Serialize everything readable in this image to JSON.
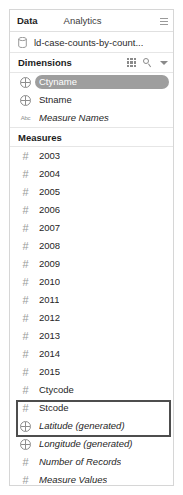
{
  "panel": {
    "tabs": [
      {
        "label": "Data",
        "active": true
      },
      {
        "label": "Analytics",
        "active": false
      }
    ],
    "sort_icon": "sort-icon"
  },
  "datasource": {
    "icon": "database-icon",
    "name": "ld-case-counts-by-count..."
  },
  "dimensions": {
    "title": "Dimensions",
    "tools": [
      {
        "icon": "grid-view-icon"
      },
      {
        "icon": "search-icon"
      },
      {
        "icon": "chevron-down-icon"
      }
    ],
    "fields": [
      {
        "label": "Ctyname",
        "icon": "globe-icon",
        "italic": false,
        "selected": true
      },
      {
        "label": "Stname",
        "icon": "globe-icon",
        "italic": false,
        "selected": false
      },
      {
        "label": "Measure Names",
        "icon": "abc-icon",
        "italic": true,
        "selected": false
      }
    ]
  },
  "measures": {
    "title": "Measures",
    "fields": [
      {
        "label": "2003",
        "icon": "hash-icon",
        "italic": false
      },
      {
        "label": "2004",
        "icon": "hash-icon",
        "italic": false
      },
      {
        "label": "2005",
        "icon": "hash-icon",
        "italic": false
      },
      {
        "label": "2006",
        "icon": "hash-icon",
        "italic": false
      },
      {
        "label": "2007",
        "icon": "hash-icon",
        "italic": false
      },
      {
        "label": "2008",
        "icon": "hash-icon",
        "italic": false
      },
      {
        "label": "2009",
        "icon": "hash-icon",
        "italic": false
      },
      {
        "label": "2010",
        "icon": "hash-icon",
        "italic": false
      },
      {
        "label": "2011",
        "icon": "hash-icon",
        "italic": false
      },
      {
        "label": "2012",
        "icon": "hash-icon",
        "italic": false
      },
      {
        "label": "2013",
        "icon": "hash-icon",
        "italic": false
      },
      {
        "label": "2014",
        "icon": "hash-icon",
        "italic": false
      },
      {
        "label": "2015",
        "icon": "hash-icon",
        "italic": false
      },
      {
        "label": "Ctycode",
        "icon": "hash-icon",
        "italic": false
      },
      {
        "label": "Stcode",
        "icon": "hash-icon",
        "italic": false
      },
      {
        "label": "Latitude (generated)",
        "icon": "globe-icon",
        "italic": true
      },
      {
        "label": "Longitude (generated)",
        "icon": "globe-icon",
        "italic": true
      },
      {
        "label": "Number of Records",
        "icon": "hash-icon",
        "italic": true
      },
      {
        "label": "Measure Values",
        "icon": "hash-icon",
        "italic": true
      }
    ]
  },
  "annotation": {
    "color": "#4d4d4d",
    "highlights": [
      "Latitude (generated)",
      "Longitude (generated)"
    ]
  }
}
